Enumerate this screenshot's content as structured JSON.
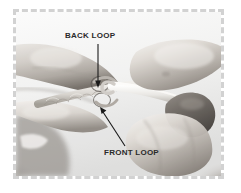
{
  "figure": {
    "kind": "instructional-photograph",
    "color_mode": "grayscale",
    "background_color": "#ffffff"
  },
  "frame": {
    "style": "dashed",
    "color": "#d2d2d2",
    "thickness_px": 3
  },
  "annotations": [
    {
      "id": "back-loop",
      "label": "BACK LOOP",
      "text_color": "#2a2a2a",
      "leader": {
        "type": "straight-vertical",
        "arrowhead": "bottom",
        "color": "#1a1a1a"
      }
    },
    {
      "id": "front-loop",
      "label": "FRONT LOOP",
      "text_color": "#2a2a2a",
      "leader": {
        "type": "straight-diagonal",
        "arrowhead": "top-left",
        "color": "#1a1a1a"
      }
    }
  ],
  "photo": {
    "elements": [
      "left-hand-holding-chain",
      "right-hand-holding-hook",
      "crochet-chain",
      "crochet-hook",
      "back-loop-circle-marker",
      "front-loop-circle-marker"
    ]
  }
}
